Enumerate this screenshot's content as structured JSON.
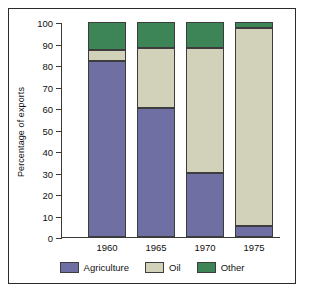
{
  "chart_data": {
    "type": "bar",
    "subtype": "stacked-bar-100-percent",
    "title": "",
    "xlabel": "",
    "ylabel": "Percentage of exports",
    "categories": [
      "1960",
      "1965",
      "1970",
      "1975"
    ],
    "series": [
      {
        "name": "Agriculture",
        "color": "#6f6fa3",
        "values": [
          82,
          60,
          30,
          5
        ]
      },
      {
        "name": "Oil",
        "color": "#d2d2bb",
        "values": [
          5,
          28,
          58,
          92
        ]
      },
      {
        "name": "Other",
        "color": "#3d8456",
        "values": [
          13,
          12,
          12,
          3
        ]
      }
    ],
    "ylim": [
      0,
      100
    ],
    "yticks": [
      0,
      10,
      20,
      30,
      40,
      50,
      60,
      70,
      80,
      90,
      100
    ],
    "ytick_labels": [
      "0",
      "10",
      "20",
      "30",
      "40",
      "50",
      "60",
      "70",
      "80",
      "90",
      "100"
    ],
    "grid": false,
    "legend_position": "bottom",
    "stack_order_bottom_to_top": [
      "Agriculture",
      "Oil",
      "Other"
    ],
    "cumulative_tops": {
      "1960": {
        "Agriculture": 82,
        "Oil": 87,
        "Other": 100
      },
      "1965": {
        "Agriculture": 60,
        "Oil": 88,
        "Other": 100
      },
      "1970": {
        "Agriculture": 30,
        "Oil": 88,
        "Other": 100
      },
      "1975": {
        "Agriculture": 5,
        "Oil": 97,
        "Other": 100
      }
    }
  },
  "axis": {
    "y_label": "Percentage of exports",
    "y_ticks": [
      "100",
      "90",
      "80",
      "70",
      "60",
      "50",
      "40",
      "30",
      "20",
      "10",
      "0"
    ],
    "x_ticks": [
      "1960",
      "1965",
      "1970",
      "1975"
    ]
  },
  "legend": {
    "items": [
      {
        "label": "Agriculture",
        "color": "#6f6fa3"
      },
      {
        "label": "Oil",
        "color": "#d2d2bb"
      },
      {
        "label": "Other",
        "color": "#3d8456"
      }
    ]
  },
  "colors": {
    "agriculture": "#6f6fa3",
    "oil": "#d2d2bb",
    "other": "#3d8456",
    "axis": "#3a3a3a",
    "border": "#2b2b2b",
    "background": "#ffffff"
  }
}
